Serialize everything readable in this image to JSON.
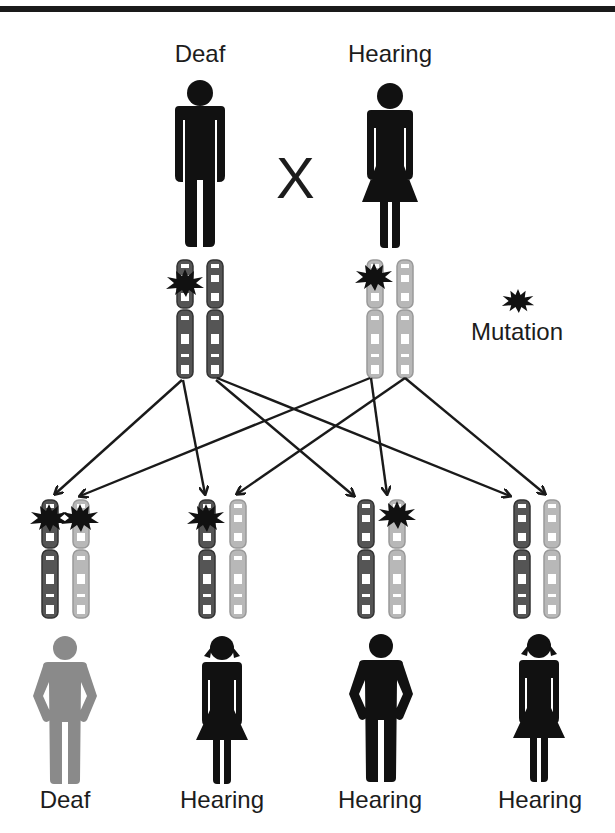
{
  "colors": {
    "affected_figure": "#111111",
    "unaffected_figure_gray": "#8a8a8a",
    "paternal_chromosome": "#555555",
    "maternal_chromosome": "#b5b5b5",
    "mutation": "#111111",
    "arrow": "#1a1a1a"
  },
  "parents": {
    "cross_symbol": "X",
    "father": {
      "label": "Deaf",
      "sex": "male",
      "chromosomes": [
        {
          "source": "paternal",
          "mutation": true
        },
        {
          "source": "paternal",
          "mutation": false
        }
      ]
    },
    "mother": {
      "label": "Hearing",
      "sex": "female",
      "chromosomes": [
        {
          "source": "maternal",
          "mutation": true
        },
        {
          "source": "maternal",
          "mutation": false
        }
      ]
    }
  },
  "legend": {
    "icon": "mutation-starburst-icon",
    "label": "Mutation"
  },
  "children": [
    {
      "label": "Deaf",
      "sex": "male",
      "figure_color": "gray",
      "chromosomes": [
        {
          "source": "paternal",
          "mutation": true
        },
        {
          "source": "maternal",
          "mutation": true
        }
      ]
    },
    {
      "label": "Hearing",
      "sex": "female",
      "figure_color": "black",
      "chromosomes": [
        {
          "source": "paternal",
          "mutation": true
        },
        {
          "source": "maternal",
          "mutation": false
        }
      ]
    },
    {
      "label": "Hearing",
      "sex": "male",
      "figure_color": "black",
      "chromosomes": [
        {
          "source": "paternal",
          "mutation": false
        },
        {
          "source": "maternal",
          "mutation": true
        }
      ]
    },
    {
      "label": "Hearing",
      "sex": "female",
      "figure_color": "black",
      "chromosomes": [
        {
          "source": "paternal",
          "mutation": false
        },
        {
          "source": "maternal",
          "mutation": false
        }
      ]
    }
  ],
  "arrows": [
    {
      "from": "father.chromosome.1",
      "to": "child.1.paternal"
    },
    {
      "from": "father.chromosome.1",
      "to": "child.2.paternal"
    },
    {
      "from": "father.chromosome.2",
      "to": "child.3.paternal"
    },
    {
      "from": "father.chromosome.2",
      "to": "child.4.paternal"
    },
    {
      "from": "mother.chromosome.1",
      "to": "child.1.maternal"
    },
    {
      "from": "mother.chromosome.1",
      "to": "child.3.maternal"
    },
    {
      "from": "mother.chromosome.2",
      "to": "child.2.maternal"
    },
    {
      "from": "mother.chromosome.2",
      "to": "child.4.maternal"
    }
  ]
}
